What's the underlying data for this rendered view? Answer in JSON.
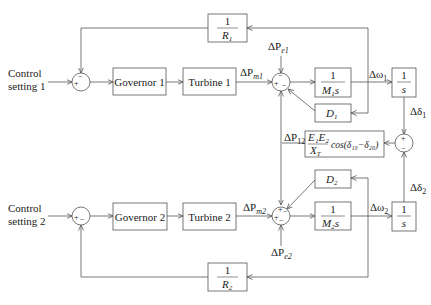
{
  "diagram": {
    "inputs": [
      {
        "label_line1": "Control",
        "label_line2": "setting 1"
      },
      {
        "label_line1": "Control",
        "label_line2": "setting 2"
      }
    ],
    "blocks": {
      "governor1": "Governor 1",
      "turbine1": "Turbine 1",
      "governor2": "Governor 2",
      "turbine2": "Turbine 2",
      "r1": {
        "num": "1",
        "den": "R",
        "sub": "1"
      },
      "r2": {
        "num": "1",
        "den": "R",
        "sub": "2"
      },
      "m1s": {
        "num": "1",
        "den": "M",
        "sub": "1",
        "suffix": "s"
      },
      "m2s": {
        "num": "1",
        "den": "M",
        "sub": "2",
        "suffix": "s"
      },
      "d1": {
        "sym": "D",
        "sub": "1"
      },
      "d2": {
        "sym": "D",
        "sub": "2"
      },
      "int1": {
        "num": "1",
        "den": "s"
      },
      "int2": {
        "num": "1",
        "den": "s"
      },
      "tie": {
        "num": "E₁E₂",
        "den": "X",
        "den_sub": "T",
        "tail": "cos(δ₁₀−δ₂₀)"
      }
    },
    "signals": {
      "pm1": "ΔP",
      "pm1_sub": "m1",
      "pe1": "ΔP",
      "pe1_sub": "e1",
      "pm2": "ΔP",
      "pm2_sub": "m2",
      "pe2": "ΔP",
      "pe2_sub": "e2",
      "w1": "Δω",
      "w1_sub": "1",
      "w2": "Δω",
      "w2_sub": "2",
      "d1": "Δδ",
      "d1_sub": "1",
      "d2": "Δδ",
      "d2_sub": "2",
      "p12": "ΔP",
      "p12_sub": "12"
    },
    "signs": {
      "plus": "+",
      "minus": "−"
    }
  }
}
